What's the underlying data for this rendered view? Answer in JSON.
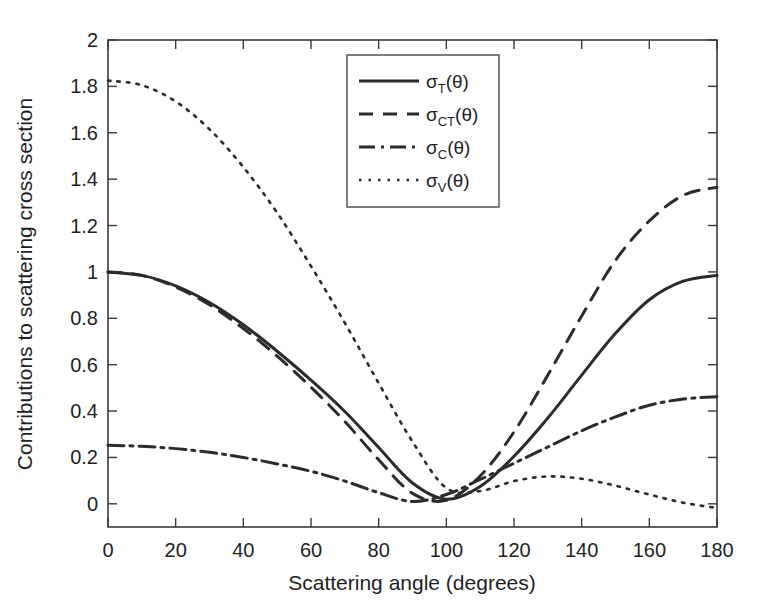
{
  "chart_data": {
    "type": "line",
    "title": "",
    "xlabel": "Scattering angle (degrees)",
    "ylabel": "Contributions to scattering cross section",
    "xlim": [
      0,
      180
    ],
    "ylim": [
      -0.1,
      2
    ],
    "grid": false,
    "legend_position": "top-center",
    "xticks": [
      0,
      20,
      40,
      60,
      80,
      100,
      120,
      140,
      160,
      180
    ],
    "xtick_labels": [
      "0",
      "20",
      "40",
      "60",
      "80",
      "100",
      "120",
      "140",
      "160",
      "180"
    ],
    "yticks": [
      0,
      0.2,
      0.4,
      0.6,
      0.8,
      1,
      1.2,
      1.4,
      1.6,
      1.8,
      2
    ],
    "ytick_labels": [
      "0",
      "0.2",
      "0.4",
      "0.6",
      "0.8",
      "1",
      "1.2",
      "1.4",
      "1.6",
      "1.8",
      "2"
    ],
    "x": [
      0,
      10,
      20,
      30,
      40,
      50,
      60,
      70,
      80,
      90,
      100,
      110,
      120,
      130,
      140,
      150,
      160,
      170,
      180
    ],
    "series": [
      {
        "name": "sigma_T",
        "label_base": "σ",
        "label_sub": "T",
        "label_arg": "(θ)",
        "style": "solid",
        "dasharray": "",
        "width": 3.0,
        "values": [
          1.0,
          0.985,
          0.94,
          0.868,
          0.772,
          0.658,
          0.533,
          0.398,
          0.243,
          0.09,
          0.02,
          0.075,
          0.205,
          0.37,
          0.555,
          0.735,
          0.88,
          0.96,
          0.985
        ]
      },
      {
        "name": "sigma_CT",
        "label_base": "σ",
        "label_sub": "CT",
        "label_arg": "(θ)",
        "style": "dashed",
        "dasharray": "14,10",
        "width": 3.0,
        "values": [
          1.0,
          0.985,
          0.935,
          0.858,
          0.756,
          0.637,
          0.503,
          0.355,
          0.19,
          0.045,
          0.015,
          0.12,
          0.31,
          0.555,
          0.81,
          1.05,
          1.22,
          1.33,
          1.365
        ]
      },
      {
        "name": "sigma_C",
        "label_base": "σ",
        "label_sub": "C",
        "label_arg": "(θ)",
        "style": "dash-dot",
        "dasharray": "16,6,3,6",
        "width": 3.0,
        "values": [
          0.252,
          0.248,
          0.238,
          0.222,
          0.2,
          0.172,
          0.14,
          0.098,
          0.048,
          0.01,
          0.04,
          0.105,
          0.175,
          0.245,
          0.315,
          0.375,
          0.425,
          0.452,
          0.462
        ]
      },
      {
        "name": "sigma_V",
        "label_base": "σ",
        "label_sub": "V",
        "label_arg": "(θ)",
        "style": "dotted",
        "dasharray": "2.5,7",
        "width": 2.6,
        "values": [
          1.825,
          1.805,
          1.735,
          1.615,
          1.452,
          1.255,
          1.025,
          0.78,
          0.52,
          0.268,
          0.068,
          0.055,
          0.098,
          0.118,
          0.108,
          0.078,
          0.04,
          0.005,
          -0.018
        ]
      }
    ]
  }
}
